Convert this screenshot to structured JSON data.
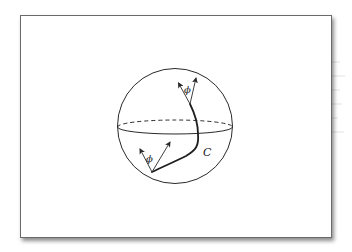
{
  "figure": {
    "labels": {
      "top_angle": "ϕ",
      "bottom_angle": "ϕ",
      "curve": "C"
    },
    "colors": {
      "stroke": "#2a2a2a",
      "frame_border": "#6a6a6a",
      "background": "#ffffff"
    }
  }
}
